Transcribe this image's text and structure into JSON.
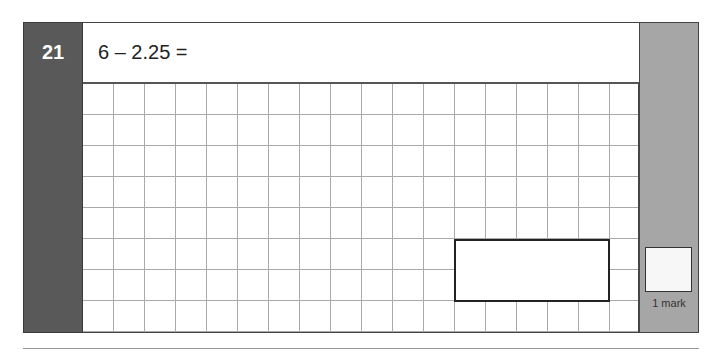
{
  "question": {
    "number": "21",
    "text": "6 – 2.25 =",
    "marks_label": "1 mark"
  },
  "colors": {
    "number_panel": "#595959",
    "marks_panel": "#a6a6a6",
    "grid_line": "#aaaaaa"
  }
}
